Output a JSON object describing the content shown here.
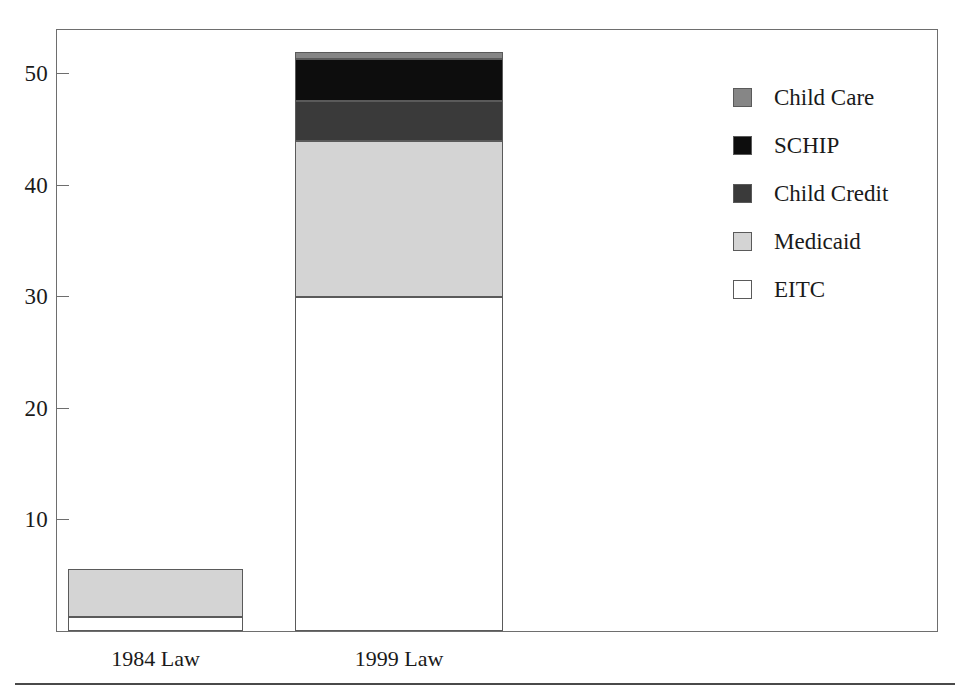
{
  "chart_data": {
    "type": "bar",
    "subtype": "stacked-vertical",
    "title": "",
    "xlabel": "",
    "ylabel": "",
    "categories": [
      "1984 Law",
      "1999 Law"
    ],
    "series": [
      {
        "name": "EITC",
        "values": [
          1.3,
          30.0
        ],
        "color": "#ffffff"
      },
      {
        "name": "Medicaid",
        "values": [
          4.3,
          14.0
        ],
        "color": "#d4d4d4"
      },
      {
        "name": "Child Credit",
        "values": [
          0.0,
          3.6
        ],
        "color": "#3a3a3a"
      },
      {
        "name": "SCHIP",
        "values": [
          0.0,
          3.7
        ],
        "color": "#0d0d0d"
      },
      {
        "name": "Child Care",
        "values": [
          0.0,
          0.7
        ],
        "color": "#868686"
      }
    ],
    "stack_order_bottom_to_top": [
      "EITC",
      "Medicaid",
      "Child Credit",
      "SCHIP",
      "Child Care"
    ],
    "totals": [
      5.6,
      52.0
    ],
    "ylim": [
      0,
      53.5
    ],
    "yticks": [
      10,
      20,
      30,
      40,
      50
    ],
    "ytick_labels": [
      "10",
      "20",
      "30",
      "40",
      "50"
    ],
    "grid": false,
    "legend_position": "right",
    "legend_order_top_to_bottom": [
      "Child Care",
      "SCHIP",
      "Child Credit",
      "Medicaid",
      "EITC"
    ]
  },
  "axis": {
    "ticks": [
      {
        "label": "50",
        "value": 50
      },
      {
        "label": "40",
        "value": 40
      },
      {
        "label": "30",
        "value": 30
      },
      {
        "label": "20",
        "value": 20
      },
      {
        "label": "10",
        "value": 10
      }
    ]
  },
  "bars": [
    {
      "category": "1984 Law",
      "segments": [
        {
          "name": "EITC",
          "value": 1.3,
          "from": 0.0,
          "to": 1.3,
          "color": "#ffffff"
        },
        {
          "name": "Medicaid",
          "value": 4.3,
          "from": 1.3,
          "to": 5.6,
          "color": "#d4d4d4"
        }
      ]
    },
    {
      "category": "1999 Law",
      "segments": [
        {
          "name": "EITC",
          "value": 30.0,
          "from": 0.0,
          "to": 30.0,
          "color": "#ffffff"
        },
        {
          "name": "Medicaid",
          "value": 14.0,
          "from": 30.0,
          "to": 44.0,
          "color": "#d4d4d4"
        },
        {
          "name": "Child Credit",
          "value": 3.6,
          "from": 44.0,
          "to": 47.6,
          "color": "#3a3a3a"
        },
        {
          "name": "SCHIP",
          "value": 3.7,
          "from": 47.6,
          "to": 51.3,
          "color": "#0d0d0d"
        },
        {
          "name": "Child Care",
          "value": 0.7,
          "from": 51.3,
          "to": 52.0,
          "color": "#868686"
        }
      ]
    }
  ],
  "legend": {
    "items": [
      {
        "label": "Child Care",
        "color": "#868686"
      },
      {
        "label": "SCHIP",
        "color": "#0d0d0d"
      },
      {
        "label": "Child Credit",
        "color": "#3a3a3a"
      },
      {
        "label": "Medicaid",
        "color": "#d4d4d4"
      },
      {
        "label": "EITC",
        "color": "#ffffff"
      }
    ]
  },
  "category_labels": [
    {
      "label": "1984 Law"
    },
    {
      "label": "1999 Law"
    }
  ],
  "colors": {
    "frame": "#6e6e6e",
    "segment_outline": "#5a5a5a",
    "text": "#1a1a1a",
    "rule": "#4a4a4a",
    "background": "#ffffff"
  }
}
